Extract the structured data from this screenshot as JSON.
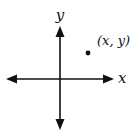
{
  "diagram": {
    "type": "coordinate-plane",
    "x_axis_label": "x",
    "y_axis_label": "y",
    "point_label": "(x, y)",
    "point_quadrant": "I",
    "colors": {
      "axis": "#111111",
      "point": "#111111",
      "background": "#ffffff"
    }
  }
}
